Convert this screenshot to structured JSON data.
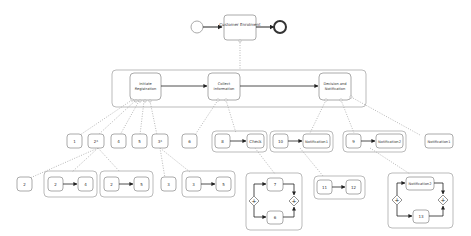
{
  "diagram": {
    "colors": {
      "stroke": "#9a9a9a",
      "task_fill": "#ffffff",
      "arrow": "#222222",
      "text": "#333333"
    },
    "top": {
      "start_event": "start",
      "task": "Customer Enrolment",
      "end_event": "end"
    },
    "level1": {
      "tasks": [
        "Initiate Registration",
        "Collect Information",
        "Decision and Notification"
      ]
    },
    "initiate_children": [
      "1",
      "2*",
      "4",
      "5",
      "3*"
    ],
    "two_star_children": {
      "single": "2",
      "seq_a": [
        "2",
        "4"
      ],
      "seq_b": [
        "2",
        "5"
      ]
    },
    "three_star_children": {
      "single": "3",
      "seq": [
        "3",
        "5"
      ]
    },
    "collect_children": {
      "single": "6",
      "seq": [
        "8",
        "Check"
      ],
      "parallel": [
        "7",
        "6"
      ]
    },
    "decision_children": {
      "seq_a": [
        "10",
        "Notification1"
      ],
      "seq_a_child": [
        "11",
        "12"
      ],
      "seq_b": [
        "9",
        "Notification2"
      ],
      "single": "Notification1",
      "parallel": [
        "Notification2",
        "13"
      ]
    }
  }
}
